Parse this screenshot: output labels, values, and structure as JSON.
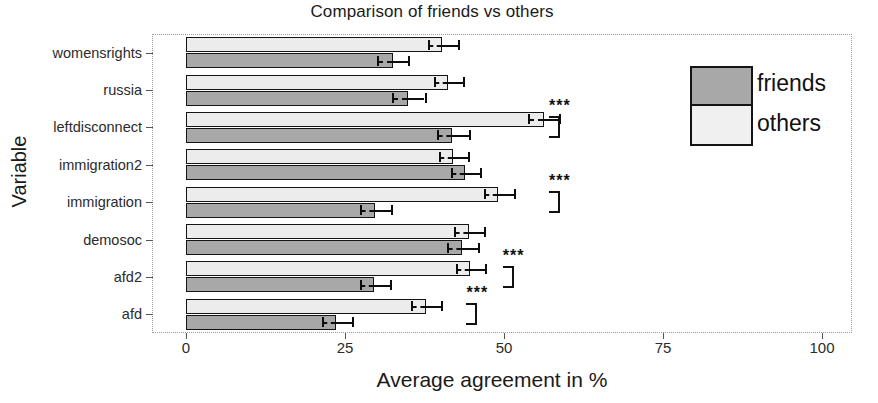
{
  "chart_data": {
    "type": "bar",
    "orientation": "horizontal",
    "title": "Comparison of friends vs others",
    "xlabel": "Average agreement in %",
    "ylabel": "Variable",
    "xlim": [
      0,
      100
    ],
    "xticks": [
      0,
      25,
      50,
      75,
      100
    ],
    "grid": false,
    "legend_position": "top-right",
    "categories": [
      "womensrights",
      "russia",
      "leftdisconnect",
      "immigration2",
      "immigration",
      "demosoc",
      "afd2",
      "afd"
    ],
    "series": [
      {
        "name": "friends",
        "color": "#a8a8a8",
        "values": [
          32.5,
          34.9,
          41.8,
          43.9,
          29.7,
          43.4,
          29.6,
          23.6
        ],
        "err_low": [
          30.1,
          32.4,
          39.4,
          41.6,
          27.3,
          41.1,
          27.3,
          21.4
        ],
        "err_high": [
          34.9,
          37.5,
          44.5,
          46.3,
          32.3,
          45.9,
          32.0,
          26.1
        ]
      },
      {
        "name": "others",
        "color": "#ececec",
        "values": [
          40.3,
          41.2,
          56.3,
          42.0,
          49.1,
          44.5,
          44.7,
          37.7
        ],
        "err_low": [
          38.0,
          39.0,
          53.8,
          39.8,
          46.9,
          42.2,
          42.4,
          35.4
        ],
        "err_high": [
          42.7,
          43.6,
          58.7,
          44.3,
          51.5,
          46.9,
          47.0,
          40.1
        ]
      }
    ],
    "annotations": [
      {
        "label": "***",
        "category": "leftdisconnect",
        "x": 58.8
      },
      {
        "label": "***",
        "category": "immigration",
        "x": 58.8
      },
      {
        "label": "***",
        "category": "afd2",
        "x": 51.5
      },
      {
        "label": "***",
        "category": "afd",
        "x": 45.8
      }
    ]
  },
  "legend": {
    "items": [
      {
        "label": "friends",
        "swatch": "friends-swatch"
      },
      {
        "label": "others",
        "swatch": "others-swatch"
      }
    ]
  }
}
